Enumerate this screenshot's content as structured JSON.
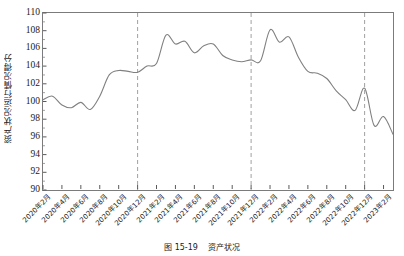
{
  "figure": {
    "caption_number": "图 15-19",
    "caption_text": "资产状况",
    "ylabel": "资产状况运行情况得分"
  },
  "chart_data": {
    "type": "line",
    "title": "",
    "xlabel": "",
    "ylabel": "资产状况运行情况得分",
    "ylim": [
      90,
      110
    ],
    "ytick_step": 2,
    "yticks": [
      90,
      92,
      94,
      96,
      98,
      100,
      102,
      104,
      106,
      108,
      110
    ],
    "grid": false,
    "legend": "none",
    "line_color": "#808080",
    "reference_line_color": "#a0a0a0",
    "reference_line_style": "dashed",
    "reference_lines": [
      "2020年12月",
      "2021年12月",
      "2022年12月"
    ],
    "xtick_labels": [
      "2020年2月",
      "2020年4月",
      "2020年6月",
      "2020年8月",
      "2020年10月",
      "2020年12月",
      "2021年2月",
      "2021年4月",
      "2021年6月",
      "2021年8月",
      "2021年10月",
      "2021年12月",
      "2022年2月",
      "2022年4月",
      "2022年6月",
      "2022年8月",
      "2022年10月",
      "2022年12月",
      "2023年2月"
    ],
    "categories": [
      "2020年2月",
      "2020年3月",
      "2020年4月",
      "2020年5月",
      "2020年6月",
      "2020年7月",
      "2020年8月",
      "2020年9月",
      "2020年10月",
      "2020年11月",
      "2020年12月",
      "2021年1月",
      "2021年2月",
      "2021年3月",
      "2021年4月",
      "2021年5月",
      "2021年6月",
      "2021年7月",
      "2021年8月",
      "2021年9月",
      "2021年10月",
      "2021年11月",
      "2021年12月",
      "2022年1月",
      "2022年2月",
      "2022年3月",
      "2022年4月",
      "2022年5月",
      "2022年6月",
      "2022年7月",
      "2022年8月",
      "2022年9月",
      "2022年10月",
      "2022年11月",
      "2022年12月",
      "2023年1月",
      "2023年2月",
      "2023年3月"
    ],
    "values": [
      100.2,
      100.6,
      99.6,
      99.3,
      99.9,
      99.1,
      100.6,
      103.0,
      103.5,
      103.4,
      103.3,
      104.0,
      104.3,
      107.5,
      106.5,
      106.8,
      105.5,
      106.3,
      106.5,
      105.2,
      104.7,
      104.5,
      104.7,
      104.6,
      108.1,
      106.7,
      107.3,
      105.0,
      103.4,
      103.2,
      102.6,
      101.2,
      100.2,
      99.0,
      101.5,
      97.3,
      98.3,
      96.3
    ]
  }
}
